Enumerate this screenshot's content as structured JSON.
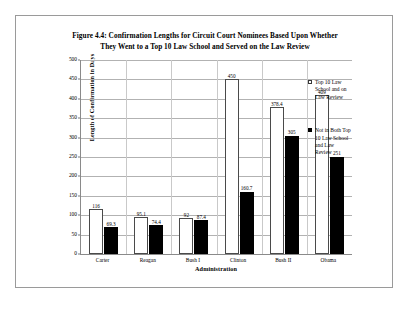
{
  "figure": {
    "title_lines": [
      "Figure 4.4: Confirmation Lengths for Circuit Court Nominees Based Upon Whether",
      "They Went to a Top 10 Law School and Served on the Law Review"
    ]
  },
  "legend": {
    "entries": [
      {
        "swatch": "light-square-icon",
        "text_lines": [
          "Top 10 Law",
          "School and on",
          "Law Review"
        ]
      },
      {
        "swatch": "dark-square-icon",
        "text_lines": [
          "Not in Both Top",
          "10 Law School",
          "and Law",
          "Review"
        ]
      }
    ]
  },
  "chart_data": {
    "type": "bar",
    "title": "Figure 4.4: Confirmation Lengths for Circuit Court Nominees Based Upon Whether They Went to a Top 10 Law School and Served on the Law Review",
    "xlabel": "Administration",
    "ylabel": "Length of Confirmation in Days",
    "categories": [
      "Carter",
      "Reagan",
      "Bush I",
      "Clinton",
      "Bush II",
      "Obama"
    ],
    "series": [
      {
        "name": "Top 10 Law School and on Law Review",
        "color": "#ffffff",
        "values": [
          116,
          95.1,
          92,
          450,
          378.4,
          409
        ],
        "labels": [
          "116",
          "95.1",
          "92",
          "450",
          "378.4",
          "409"
        ]
      },
      {
        "name": "Not in Both Top 10 Law School and Law Review",
        "color": "#000000",
        "values": [
          69.3,
          74.4,
          87.4,
          160.7,
          305,
          251
        ],
        "labels": [
          "69.3",
          "74.4",
          "87.4",
          "160.7",
          "305",
          "251"
        ]
      }
    ],
    "ylim": [
      0,
      500
    ],
    "yticks": [
      0,
      50,
      100,
      150,
      200,
      250,
      300,
      350,
      400,
      450,
      500
    ],
    "ytick_labels": [
      "0",
      "50",
      "100",
      "150",
      "200",
      "250",
      "300",
      "350",
      "400",
      "450",
      "500"
    ],
    "grid": true,
    "legend_position": "right"
  }
}
